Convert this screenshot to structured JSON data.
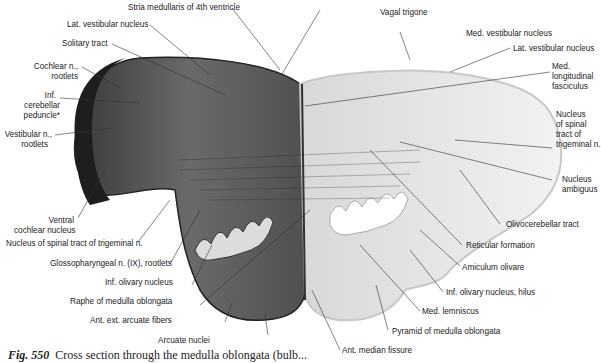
{
  "figure": {
    "number": "Fig. 550",
    "caption": "Cross section through the medulla oblongata (bulb..."
  },
  "labels_left": [
    {
      "id": "stria",
      "text": "Stria medullaris of 4th ventricle"
    },
    {
      "id": "lat_vest_l",
      "text": "Lat. vestibular nucleus"
    },
    {
      "id": "solitary",
      "text": "Solitary tract"
    },
    {
      "id": "cochlear_1",
      "text": "Cochlear n.,"
    },
    {
      "id": "cochlear_2",
      "text": "rootlets"
    },
    {
      "id": "icp_1",
      "text": "Inf."
    },
    {
      "id": "icp_2",
      "text": "cerebellar"
    },
    {
      "id": "icp_3",
      "text": "peduncle*"
    },
    {
      "id": "vest_1",
      "text": "Vestibular n.,"
    },
    {
      "id": "vest_2",
      "text": "rootlets"
    },
    {
      "id": "vcn_1",
      "text": "Ventral"
    },
    {
      "id": "vcn_2",
      "text": "cochlear nucleus"
    },
    {
      "id": "spinal5",
      "text": "Nucleus of spinal tract of trigeminal n."
    },
    {
      "id": "glosso",
      "text": "Glossopharyngeal n. (IX), rootlets"
    },
    {
      "id": "inf_oliv",
      "text": "Inf. olivary nucleus"
    },
    {
      "id": "raphe",
      "text": "Raphe of medulla oblongata"
    },
    {
      "id": "ant_ext",
      "text": "Ant. ext. arcuate fibers"
    },
    {
      "id": "arcuate",
      "text": "Arcuate nuclei"
    }
  ],
  "labels_right": [
    {
      "id": "vagal",
      "text": "Vagal trigone"
    },
    {
      "id": "med_vest",
      "text": "Med. vestibular nucleus"
    },
    {
      "id": "lat_vest_r",
      "text": "Lat. vestibular nucleus"
    },
    {
      "id": "mlf_1",
      "text": "Med."
    },
    {
      "id": "mlf_2",
      "text": "longitudinal"
    },
    {
      "id": "mlf_3",
      "text": "fasciculus"
    },
    {
      "id": "nst_1",
      "text": "Nucleus"
    },
    {
      "id": "nst_2",
      "text": "of spinal"
    },
    {
      "id": "nst_3",
      "text": "tract of"
    },
    {
      "id": "nst_4",
      "text": "trigeminal n."
    },
    {
      "id": "amb_1",
      "text": "Nucleus"
    },
    {
      "id": "amb_2",
      "text": "ambiguus"
    },
    {
      "id": "olivocer",
      "text": "Olivocerebellar tract"
    },
    {
      "id": "reticular",
      "text": "Reticular formation"
    },
    {
      "id": "amiculum",
      "text": "Amiculum olivare"
    },
    {
      "id": "hilus",
      "text": "Inf. olivary nucleus, hilus"
    },
    {
      "id": "med_lem",
      "text": "Med. lemniscus"
    },
    {
      "id": "pyramid",
      "text": "Pyramid of medulla oblongata"
    },
    {
      "id": "ant_med",
      "text": "Ant. median fissure"
    }
  ],
  "colors": {
    "left_half": "#5a5a5a",
    "right_half": "#e9e9e9",
    "leader_line": "#333333",
    "text": "#222222"
  }
}
